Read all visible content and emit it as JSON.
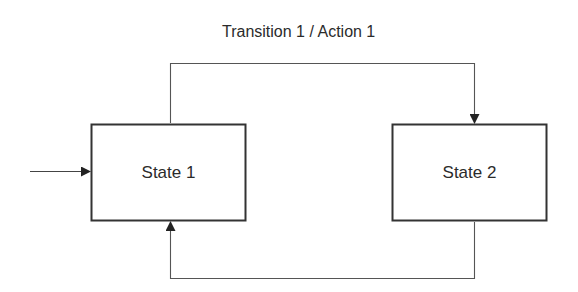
{
  "diagram": {
    "type": "state-machine",
    "transition_label": "Transition 1 / Action 1",
    "states": [
      {
        "id": "state1",
        "label": "State 1",
        "initial": true
      },
      {
        "id": "state2",
        "label": "State 2",
        "initial": false
      }
    ],
    "transitions": [
      {
        "from": "state1",
        "to": "state2",
        "label": "Transition 1 / Action 1"
      },
      {
        "from": "state2",
        "to": "state1",
        "label": ""
      }
    ],
    "colors": {
      "stroke": "#333333",
      "background": "#ffffff",
      "text": "#2b2b2b"
    }
  }
}
